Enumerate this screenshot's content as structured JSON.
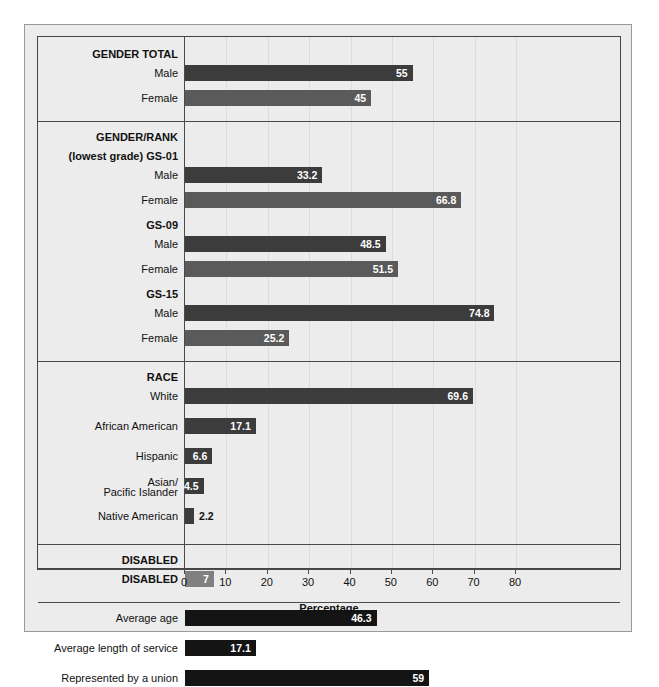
{
  "chart_data": {
    "type": "bar",
    "orientation": "horizontal",
    "title": "",
    "xlabel": "Percentage",
    "ylabel": "",
    "xlim": [
      0,
      80
    ],
    "xticks": [
      0,
      10,
      20,
      30,
      40,
      50,
      60,
      70,
      80
    ],
    "grid": true,
    "legend": "none",
    "colors": {
      "male": "#3c3c3c",
      "female": "#5a5a5a",
      "race": "#3c3c3c",
      "disabled": "#808080",
      "other": "#141414",
      "background": "#ececec",
      "frame": "#444444",
      "gridline": "#dcdcdc",
      "value_text": "#ffffff"
    },
    "sections": [
      {
        "name": "gender-total",
        "header": "GENDER TOTAL",
        "header_lines": [
          "GENDER TOTAL"
        ],
        "rows": [
          {
            "label": "Male",
            "value": 55,
            "display": "55",
            "color": "male",
            "label_inside": true
          },
          {
            "label": "Female",
            "value": 45,
            "display": "45",
            "color": "female",
            "label_inside": true
          }
        ]
      },
      {
        "name": "gender-rank",
        "header": "GENDER/RANK",
        "header_lines": [
          "GENDER/RANK",
          "(lowest grade) GS-01"
        ],
        "rows": [
          {
            "label": "Male",
            "value": 33.2,
            "display": "33.2",
            "color": "male",
            "label_inside": true
          },
          {
            "label": "Female",
            "value": 66.8,
            "display": "66.8",
            "color": "female",
            "label_inside": true
          },
          {
            "label": "GS-09",
            "value": null,
            "display": "",
            "color": null,
            "is_subheader": true
          },
          {
            "label": "Male",
            "value": 48.5,
            "display": "48.5",
            "color": "male",
            "label_inside": true
          },
          {
            "label": "Female",
            "value": 51.5,
            "display": "51.5",
            "color": "female",
            "label_inside": true
          },
          {
            "label": "GS-15",
            "value": null,
            "display": "",
            "color": null,
            "is_subheader": true
          },
          {
            "label": "Male",
            "value": 74.8,
            "display": "74.8",
            "color": "male",
            "label_inside": true
          },
          {
            "label": "Female",
            "value": 25.2,
            "display": "25.2",
            "color": "female",
            "label_inside": true
          }
        ]
      },
      {
        "name": "race",
        "header": "RACE",
        "header_lines": [
          "RACE"
        ],
        "rows": [
          {
            "label": "White",
            "value": 69.6,
            "display": "69.6",
            "color": "race",
            "label_inside": true
          },
          {
            "label": "African American",
            "value": 17.1,
            "display": "17.1",
            "color": "race",
            "label_inside": true
          },
          {
            "label": "Hispanic",
            "value": 6.6,
            "display": "6.6",
            "color": "race",
            "label_inside": true
          },
          {
            "label": "Asian/\nPacific Islander",
            "label_line1": "Asian/",
            "label_line2": "Pacific Islander",
            "value": 4.5,
            "display": "4.5",
            "color": "race",
            "label_inside": true
          },
          {
            "label": "Native American",
            "value": 2.2,
            "display": "2.2",
            "color": "race",
            "label_inside": false
          }
        ]
      },
      {
        "name": "disabled",
        "header": "DISABLED",
        "header_lines": [
          "DISABLED"
        ],
        "rows": [
          {
            "label": "DISABLED",
            "value": 7,
            "display": "7",
            "color": "disabled",
            "label_inside": true,
            "header_row": true
          }
        ]
      },
      {
        "name": "other",
        "header": "",
        "header_lines": [],
        "rows": [
          {
            "label": "Average age",
            "value": 46.3,
            "display": "46.3",
            "color": "other",
            "label_inside": true
          },
          {
            "label": "Average length of service",
            "value": 17.1,
            "display": "17.1",
            "color": "other",
            "label_inside": true
          },
          {
            "label": "Represented by a union",
            "value": 59,
            "display": "59",
            "color": "other",
            "label_inside": true
          }
        ]
      }
    ]
  }
}
